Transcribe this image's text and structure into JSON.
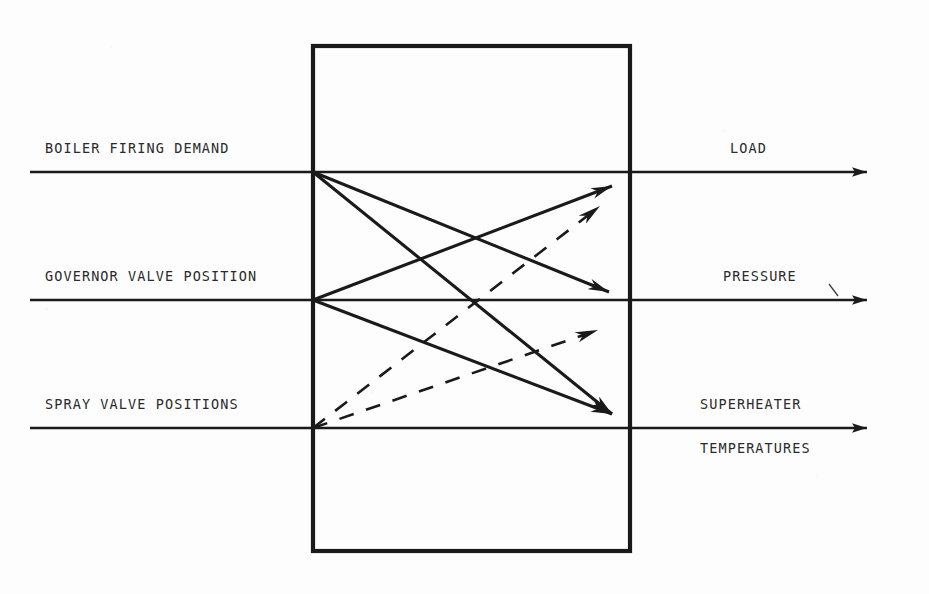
{
  "figure": {
    "kind": "block-diagram",
    "line_color": "#1a1a1a",
    "background_color": "#fdfdfd"
  },
  "block": {
    "name": "process-block",
    "label": "",
    "x": 313,
    "y": 46,
    "width": 317,
    "height": 505
  },
  "inputs": [
    {
      "id": "boiler-firing-demand",
      "label": "BOILER FIRING DEMAND",
      "y": 172
    },
    {
      "id": "governor-valve-position",
      "label": "GOVERNOR VALVE POSITION",
      "y": 300
    },
    {
      "id": "spray-valve-positions",
      "label": "SPRAY VALVE POSITIONS",
      "y": 428
    }
  ],
  "outputs": [
    {
      "id": "load",
      "label": "LOAD",
      "label2": "",
      "y": 172
    },
    {
      "id": "pressure",
      "label": "PRESSURE",
      "label2": "",
      "y": 300
    },
    {
      "id": "superheater-temperatures",
      "label": "SUPERHEATER",
      "label2": "TEMPERATURES",
      "y": 428
    }
  ],
  "couplings": {
    "solid": [
      {
        "from": "boiler-firing-demand",
        "to": "load",
        "style": "solid",
        "arrow": false
      },
      {
        "from": "boiler-firing-demand",
        "to": "pressure",
        "style": "solid",
        "arrow": true
      },
      {
        "from": "boiler-firing-demand",
        "to": "superheater-temperatures",
        "style": "solid",
        "arrow": true
      },
      {
        "from": "governor-valve-position",
        "to": "load",
        "style": "solid",
        "arrow": true
      },
      {
        "from": "governor-valve-position",
        "to": "superheater-temperatures",
        "style": "solid",
        "arrow": true
      },
      {
        "from": "spray-valve-positions",
        "to": "superheater-temperatures",
        "style": "solid",
        "arrow": false
      }
    ],
    "dashed": [
      {
        "from": "spray-valve-positions",
        "to": "load",
        "style": "dashed",
        "arrow": true
      },
      {
        "from": "spray-valve-positions",
        "to": "pressure",
        "style": "dashed",
        "arrow": true
      }
    ]
  },
  "geometry": {
    "line_left_start_x": 30,
    "line_right_end_x": 880,
    "node_left_x": 313,
    "node_right_x": 630
  }
}
